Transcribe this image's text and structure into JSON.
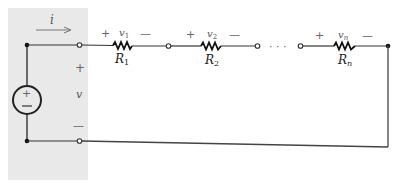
{
  "diagram": {
    "type": "series-resistor-circuit",
    "current_label": "i",
    "source": {
      "plus": "+",
      "minus": "−"
    },
    "terminal_voltage": {
      "plus": "+",
      "label": "v",
      "minus": "—"
    },
    "resistors": [
      {
        "name": "R",
        "sub": "1",
        "voltage": "v",
        "vsub": "1",
        "plus": "+",
        "minus": "—"
      },
      {
        "name": "R",
        "sub": "2",
        "voltage": "v",
        "vsub": "2",
        "plus": "+",
        "minus": "—"
      },
      {
        "name": "R",
        "sub": "n",
        "voltage": "v",
        "vsub": "n",
        "plus": "+",
        "minus": "—"
      }
    ],
    "ellipsis": "· · ·",
    "colors": {
      "shaded_region": "#e8e8e8",
      "wire": "#333333",
      "resistor": "#111111"
    }
  }
}
